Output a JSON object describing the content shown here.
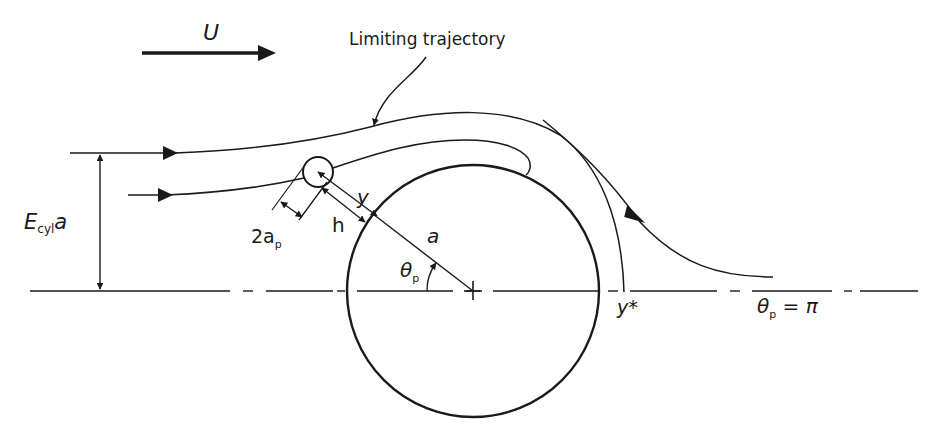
{
  "figure": {
    "free_stream_label": "U",
    "limiting_trajectory_label": "Limiting trajectory",
    "collision_efficiency_label": {
      "main": "E",
      "sub": "cyl",
      "tail": "a"
    },
    "particle_diameter_label": {
      "main": "2a",
      "sub": "p"
    },
    "gap_label": "h",
    "distance_label": "y",
    "cylinder_radius_label": "a",
    "angle_label": {
      "main": "θ",
      "sub": "p"
    },
    "y_star_label": "y*",
    "rear_angle_label": {
      "main": "θ",
      "sub": "p",
      "tail": " = π"
    }
  },
  "colors": {
    "line": "#1a1a1a",
    "background": "#ffffff"
  }
}
